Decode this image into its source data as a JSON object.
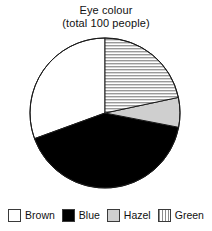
{
  "chart_data": {
    "type": "pie",
    "title": "Eye colour",
    "subtitle": "(total 100 people)",
    "title_lines": [
      "Eye colour",
      "(total 100 people)"
    ],
    "unit": "people",
    "total": 100,
    "categories": [
      "Brown",
      "Blue",
      "Hazel",
      "Green"
    ],
    "values": [
      31,
      41,
      7,
      21
    ],
    "series": [
      {
        "name": "Eye colour",
        "values": [
          31,
          41,
          7,
          21
        ]
      }
    ],
    "slices": [
      {
        "label": "Brown",
        "value": 31,
        "percent": 31,
        "start_angle_deg": 250,
        "end_angle_deg": 360,
        "sweep_deg": 110,
        "fill": "#ffffff",
        "fill_style": "solid-white",
        "stroke": "#1a1a1a"
      },
      {
        "label": "Blue",
        "value": 41,
        "percent": 41,
        "start_angle_deg": 101,
        "end_angle_deg": 250,
        "sweep_deg": 149,
        "fill": "#000000",
        "fill_style": "solid-black",
        "stroke": "#1a1a1a"
      },
      {
        "label": "Hazel",
        "value": 7,
        "percent": 7,
        "start_angle_deg": 78,
        "end_angle_deg": 101,
        "sweep_deg": 23,
        "fill": "#cfcfcf",
        "fill_style": "solid-grey",
        "stroke": "#1a1a1a"
      },
      {
        "label": "Green",
        "value": 21,
        "percent": 21,
        "start_angle_deg": 0,
        "end_angle_deg": 78,
        "sweep_deg": 78,
        "fill": "#d9d9d9",
        "fill_style": "horizontal-hatch",
        "stroke": "#1a1a1a"
      }
    ],
    "xlabel": "",
    "ylabel": "",
    "grid": false,
    "legend_position": "bottom",
    "start_angle_deg": 0,
    "direction": "clockwise",
    "geometry": {
      "center_x": 105,
      "center_y": 113,
      "radius": 75,
      "outline_color": "#1a1a1a",
      "outline_width": 1
    }
  },
  "legend": {
    "items": [
      {
        "label": "Brown",
        "swatch": "swatch-white-outline"
      },
      {
        "label": "Blue",
        "swatch": "swatch-black"
      },
      {
        "label": "Hazel",
        "swatch": "swatch-grey"
      },
      {
        "label": "Green",
        "swatch": "swatch-striped"
      }
    ]
  }
}
